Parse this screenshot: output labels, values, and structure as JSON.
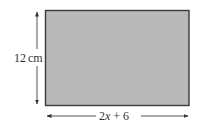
{
  "diagram": {
    "shape": "rectangle",
    "fill_color": "#b9b9b9",
    "border_color": "#3a3a3a",
    "height_label": "12 cm",
    "height_value": "12",
    "height_unit": "cm",
    "width_label": "2x + 6",
    "width_parts": {
      "coef": "2",
      "var": "x",
      "rest": " + 6"
    }
  }
}
